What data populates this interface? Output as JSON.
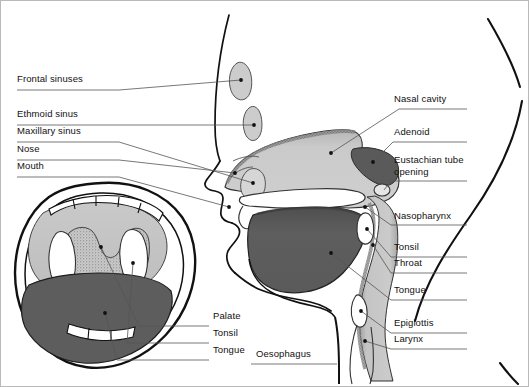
{
  "figure": {
    "background_color": "#ffffff",
    "border_color": "#b9b9b9",
    "line_color": "#111111",
    "leader_color": "#555555"
  },
  "palette": {
    "tissue_light": "#cfcfcf",
    "tissue_mid": "#b4b4b4",
    "tongue_dark": "#5d5d5d",
    "adenoid_dark": "#5a5a5a",
    "white": "#ffffff",
    "outline": "#111111",
    "stipple": "#8a8a8a"
  },
  "labels_left": [
    {
      "text": "Frontal sinuses",
      "x": 16,
      "y": 78
    },
    {
      "text": "Ethmoid sinus",
      "x": 16,
      "y": 113
    },
    {
      "text": "Maxillary sinus",
      "x": 16,
      "y": 130
    },
    {
      "text": "Nose",
      "x": 16,
      "y": 148
    },
    {
      "text": "Mouth",
      "x": 16,
      "y": 165
    }
  ],
  "labels_right": [
    {
      "text": "Nasal cavity",
      "x": 393,
      "y": 98
    },
    {
      "text": "Adenoid",
      "x": 393,
      "y": 131
    },
    {
      "text": "Eustachian tube",
      "x": 393,
      "y": 159
    },
    {
      "text": "opening",
      "x": 393,
      "y": 171
    },
    {
      "text": "Nasopharynx",
      "x": 393,
      "y": 215
    },
    {
      "text": "Tonsil",
      "x": 393,
      "y": 246
    },
    {
      "text": "Throat",
      "x": 393,
      "y": 262
    },
    {
      "text": "Tongue",
      "x": 393,
      "y": 289
    },
    {
      "text": "Epiglottis",
      "x": 393,
      "y": 322
    },
    {
      "text": "Larynx",
      "x": 393,
      "y": 338
    }
  ],
  "labels_inset": [
    {
      "text": "Palate",
      "x": 212,
      "y": 315
    },
    {
      "text": "Tonsil",
      "x": 212,
      "y": 332
    },
    {
      "text": "Tongue",
      "x": 212,
      "y": 349
    }
  ],
  "labels_center": [
    {
      "text": "Oesophagus",
      "x": 255,
      "y": 353
    }
  ],
  "structures": [
    "frontal sinus",
    "ethmoid sinus",
    "maxillary sinus",
    "nasal cavity",
    "adenoid",
    "eustachian tube opening",
    "nasopharynx",
    "tonsil",
    "throat",
    "tongue",
    "epiglottis",
    "larynx",
    "oesophagus",
    "palate",
    "mouth",
    "nose",
    "teeth",
    "uvula"
  ]
}
